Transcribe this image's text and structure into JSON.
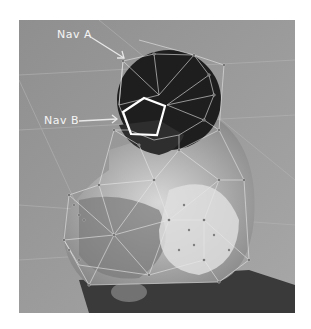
{
  "figure": {
    "labels": [
      {
        "text": "Nav A",
        "target": "top of head"
      },
      {
        "text": "Nav B",
        "target": "face region polygon"
      }
    ],
    "colors": {
      "background": "#9a9a9a",
      "mesh": "#e8e8e8",
      "highlight": "#ffffff",
      "hair": "#1e1e1e",
      "bench": "#3a3a3a"
    }
  }
}
